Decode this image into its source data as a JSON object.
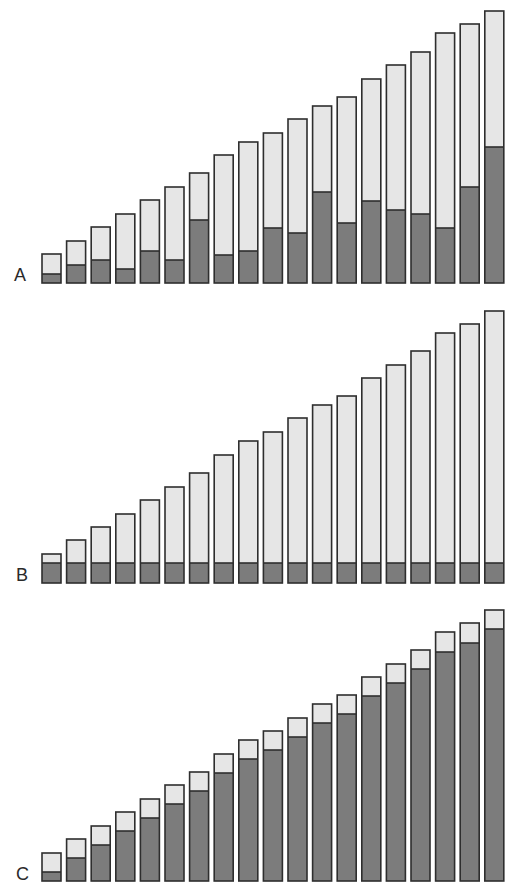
{
  "chart_data": [
    {
      "type": "bar",
      "stacked": true,
      "panel_label": "A",
      "title": "",
      "xlabel": "",
      "ylabel": "",
      "grid": false,
      "legend": null,
      "categories": [
        "1",
        "2",
        "3",
        "4",
        "5",
        "6",
        "7",
        "8",
        "9",
        "10",
        "11",
        "12",
        "13",
        "14",
        "15",
        "16",
        "17",
        "18",
        "19"
      ],
      "totals": [
        29,
        42,
        56,
        69,
        83,
        96,
        110,
        128,
        141,
        150,
        164,
        177,
        186,
        204,
        218,
        231,
        250,
        259,
        272
      ],
      "series": [
        {
          "name": "dark (bottom)",
          "color": "#7c7c7c",
          "values": [
            9,
            18,
            23,
            14,
            32,
            23,
            63,
            28,
            32,
            55,
            50,
            91,
            60,
            82,
            73,
            69,
            55,
            96,
            136
          ]
        },
        {
          "name": "light (top)",
          "color": "#e6e6e6",
          "values": [
            20,
            24,
            33,
            55,
            51,
            73,
            47,
            100,
            109,
            95,
            114,
            86,
            126,
            122,
            145,
            162,
            195,
            163,
            136
          ]
        }
      ]
    },
    {
      "type": "bar",
      "stacked": true,
      "panel_label": "B",
      "title": "",
      "xlabel": "",
      "ylabel": "",
      "grid": false,
      "legend": null,
      "categories": [
        "1",
        "2",
        "3",
        "4",
        "5",
        "6",
        "7",
        "8",
        "9",
        "10",
        "11",
        "12",
        "13",
        "14",
        "15",
        "16",
        "17",
        "18",
        "19"
      ],
      "totals": [
        29,
        43,
        56,
        69,
        83,
        96,
        110,
        128,
        142,
        151,
        165,
        178,
        187,
        205,
        218,
        232,
        250,
        259,
        272
      ],
      "series": [
        {
          "name": "dark (bottom)",
          "color": "#7c7c7c",
          "values": [
            20,
            20,
            20,
            20,
            20,
            20,
            20,
            20,
            20,
            20,
            20,
            20,
            20,
            20,
            20,
            20,
            20,
            20,
            20
          ]
        },
        {
          "name": "light (top)",
          "color": "#e6e6e6",
          "values": [
            9,
            23,
            36,
            49,
            63,
            76,
            90,
            108,
            122,
            131,
            145,
            158,
            167,
            185,
            198,
            212,
            230,
            239,
            252
          ]
        }
      ]
    },
    {
      "type": "bar",
      "stacked": true,
      "panel_label": "C",
      "title": "",
      "xlabel": "",
      "ylabel": "",
      "grid": false,
      "legend": null,
      "categories": [
        "1",
        "2",
        "3",
        "4",
        "5",
        "6",
        "7",
        "8",
        "9",
        "10",
        "11",
        "12",
        "13",
        "14",
        "15",
        "16",
        "17",
        "18",
        "19"
      ],
      "totals": [
        28,
        42,
        55,
        69,
        82,
        96,
        109,
        127,
        141,
        150,
        163,
        177,
        186,
        204,
        217,
        231,
        249,
        258,
        271
      ],
      "series": [
        {
          "name": "dark (bottom)",
          "color": "#7c7c7c",
          "values": [
            9,
            23,
            36,
            50,
            63,
            77,
            90,
            108,
            122,
            131,
            144,
            158,
            167,
            185,
            198,
            212,
            229,
            238,
            252
          ]
        },
        {
          "name": "light (top)",
          "color": "#e6e6e6",
          "values": [
            19,
            19,
            19,
            19,
            19,
            19,
            19,
            19,
            19,
            19,
            19,
            19,
            19,
            19,
            19,
            19,
            20,
            20,
            19
          ]
        }
      ]
    }
  ],
  "layout": {
    "panels": [
      {
        "label": "A",
        "baseline_y": 283,
        "label_x": 14,
        "label_y": 281
      },
      {
        "label": "B",
        "baseline_y": 583,
        "label_x": 16,
        "label_y": 581
      },
      {
        "label": "C",
        "baseline_y": 881,
        "label_x": 16,
        "label_y": 880
      }
    ],
    "bar_start_x": 42,
    "bar_pitch": 24.6,
    "bar_width": 19
  }
}
